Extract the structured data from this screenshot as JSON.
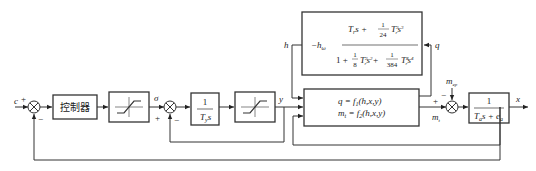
{
  "diagram": {
    "type": "control-block-diagram",
    "inputs": {
      "c": "c",
      "m_ep": "m",
      "m_ep_sub": "ep"
    },
    "signs": {
      "sum1_plus": "+",
      "sum1_minus": "−",
      "sum2_plus": "+",
      "sum2_minus": "−",
      "sum3_plus": "+",
      "sum3_minus": "−"
    },
    "signals": {
      "sigma": "σ",
      "y": "y",
      "h": "h",
      "q": "q",
      "m_t": "m",
      "m_t_sub": "t",
      "x": "x"
    },
    "blocks": {
      "controller": {
        "label": "控制器"
      },
      "saturation1": {
        "label": "saturation"
      },
      "integrator": {
        "num": "1",
        "den_T": "T",
        "den_sub": "y",
        "den_s": "s"
      },
      "saturation2": {
        "label": "saturation"
      },
      "hinge": {
        "gain": "−h",
        "gain_sub": "ω",
        "num_a": "T",
        "num_a_sub": "r",
        "num_b": "s +",
        "num_frac_n": "1",
        "num_frac_d": "24",
        "num_c": "T",
        "num_c_sup": "3",
        "num_c_sub": "r",
        "num_d": "s",
        "num_d_sup": "3",
        "den_a": "1 +",
        "den_frac1_n": "1",
        "den_frac1_d": "8",
        "den_b": "T",
        "den_b_sup": "2",
        "den_b_sub": "r",
        "den_c": "s",
        "den_c_sup": "2",
        "den_plus": "+",
        "den_frac2_n": "1",
        "den_frac2_d": "384",
        "den_d": "T",
        "den_d_sup": "4",
        "den_d_sub": "r",
        "den_e": "s",
        "den_e_sup": "4"
      },
      "nonlinear": {
        "line1": "q = f",
        "line1_sub": "1",
        "line1_args": "(h,x,y)",
        "line2": "m",
        "line2_sub": "t",
        "line2_eq": " = f",
        "line2_sub2": "2",
        "line2_args": "(h,x,y)"
      },
      "plant": {
        "num": "1",
        "den_T": "T",
        "den_T_sub": "a",
        "den_mid": "s + e",
        "den_e_sub": "a"
      }
    }
  }
}
